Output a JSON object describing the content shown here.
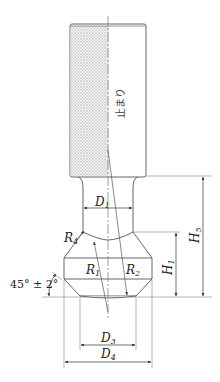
{
  "drawing": {
    "subject": "gauge pin (no-go end)",
    "handle_text": "止まり",
    "labels": {
      "D1": {
        "main": "D",
        "sub": "1"
      },
      "D3": {
        "main": "D",
        "sub": "3"
      },
      "D4": {
        "main": "D",
        "sub": "4"
      },
      "R1": {
        "main": "R",
        "sub": "1"
      },
      "R2": {
        "main": "R",
        "sub": "2"
      },
      "R4": {
        "main": "R",
        "sub": "4"
      },
      "H1": {
        "main": "H",
        "sub": "1"
      },
      "H5": {
        "main": "H",
        "sub": "5"
      },
      "angle": "45° ± 2°"
    },
    "colors": {
      "line": "#555555",
      "hatch": "#bbbbbb",
      "text": "#222222",
      "background": "#ffffff"
    }
  }
}
